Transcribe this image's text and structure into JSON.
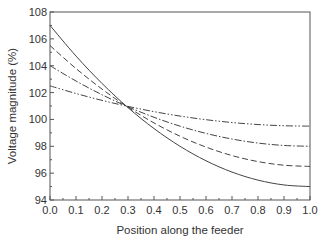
{
  "chart_data": {
    "type": "line",
    "title": "",
    "xlabel": "Position along the feeder",
    "ylabel": "Voltage magnitude (%)",
    "xlim": [
      0.0,
      1.0
    ],
    "ylim": [
      94,
      108
    ],
    "grid": false,
    "legend": null,
    "x_ticks": [
      "0.0",
      "0.1",
      "0.2",
      "0.3",
      "0.4",
      "0.5",
      "0.6",
      "0.7",
      "0.8",
      "0.9",
      "1.0"
    ],
    "y_ticks": [
      "94",
      "96",
      "98",
      "100",
      "102",
      "104",
      "106",
      "108"
    ],
    "x": [
      0.0,
      0.1,
      0.2,
      0.3,
      0.4,
      0.5,
      0.6,
      0.7,
      0.8,
      0.9,
      1.0
    ],
    "series": [
      {
        "name": "solid",
        "style": "solid",
        "values": [
          107.0,
          104.72,
          102.68,
          100.88,
          99.32,
          98.0,
          96.92,
          96.08,
          95.48,
          95.12,
          95.0
        ]
      },
      {
        "name": "dashed",
        "style": "dashed",
        "values": [
          105.5,
          103.79,
          102.26,
          100.91,
          99.74,
          98.75,
          97.94,
          97.31,
          96.86,
          96.59,
          96.5
        ]
      },
      {
        "name": "dash-dot",
        "style": "dash-dot",
        "values": [
          104.0,
          102.86,
          101.84,
          100.94,
          100.16,
          99.5,
          98.96,
          98.54,
          98.24,
          98.06,
          98.0
        ]
      },
      {
        "name": "dash-dot-dot",
        "style": "dash-dot-dot",
        "values": [
          102.5,
          101.93,
          101.42,
          100.97,
          100.58,
          100.25,
          99.98,
          99.77,
          99.62,
          99.53,
          99.5
        ]
      }
    ],
    "annotations": []
  }
}
